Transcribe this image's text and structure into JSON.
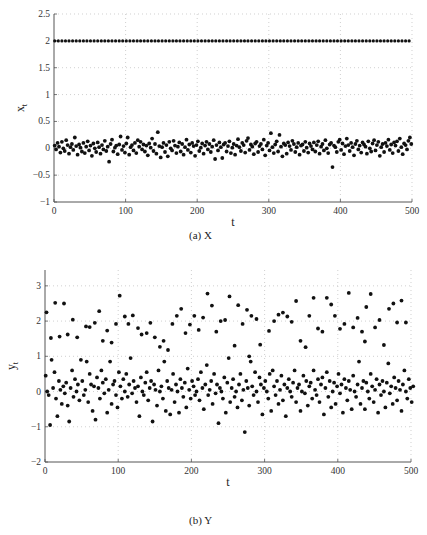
{
  "chart_data": [
    {
      "id": "X",
      "type": "scatter",
      "caption": "(a) X",
      "title": "",
      "xlabel": "t",
      "ylabel": "x",
      "ylabel_sub": "t",
      "xlim": [
        0,
        500
      ],
      "ylim": [
        -1,
        2.5
      ],
      "xticks": [
        0,
        100,
        200,
        300,
        400,
        500
      ],
      "yticks": [
        -1,
        -0.5,
        0,
        0.5,
        1,
        1.5,
        2,
        2.5
      ],
      "ytick_labels": [
        "−1",
        "−0.5",
        "0",
        "0.5",
        "1",
        "1.5",
        "2",
        "2.5"
      ],
      "grid": true,
      "legend": null,
      "frame": {
        "left": 54,
        "right": 412,
        "top": 14,
        "bottom": 202
      },
      "series": [
        {
          "name": "constant",
          "note": "points at x_t = 2 for every t",
          "t_start": 1,
          "t_end": 500,
          "t_step": 5,
          "value": 2
        },
        {
          "name": "noise",
          "note": "noise around 0, t = 1,3,5,...,499",
          "t_start": 1,
          "t_step": 2,
          "values": [
            0.05,
            -0.02,
            0.1,
            0.03,
            -0.08,
            0.12,
            0.0,
            -0.05,
            0.15,
            0.06,
            -0.1,
            0.02,
            0.08,
            -0.03,
            0.2,
            0.04,
            -0.12,
            0.07,
            0.01,
            -0.06,
            0.1,
            -0.09,
            0.03,
            0.13,
            -0.04,
            0.05,
            -0.14,
            0.09,
            0.0,
            -0.07,
            0.11,
            0.02,
            -0.1,
            0.06,
            -0.02,
            0.14,
            -0.05,
            0.03,
            -0.25,
            0.08,
            0.16,
            -0.06,
            0.01,
            0.05,
            -0.11,
            0.07,
            0.22,
            -0.03,
            0.04,
            -0.08,
            0.09,
            0.2,
            -0.12,
            0.02,
            0.06,
            -0.04,
            0.1,
            -0.09,
            0.15,
            0.03,
            0.12,
            -0.02,
            0.07,
            -0.06,
            0.05,
            -0.13,
            0.09,
            0.01,
            0.18,
            -0.05,
            0.08,
            -0.1,
            0.3,
            0.04,
            -0.17,
            0.02,
            0.1,
            -0.07,
            0.06,
            -0.15,
            0.12,
            0.0,
            -0.04,
            0.14,
            0.05,
            -0.09,
            0.03,
            0.11,
            -0.06,
            0.08,
            -0.12,
            0.02,
            0.16,
            -0.03,
            0.07,
            -0.08,
            0.1,
            0.04,
            -0.14,
            0.06,
            0.13,
            -0.05,
            0.01,
            0.09,
            -0.1,
            0.05,
            0.12,
            -0.02,
            0.08,
            -0.07,
            0.03,
            0.15,
            -0.2,
            0.06,
            -0.04,
            0.11,
            0.02,
            -0.18,
            0.07,
            0.1,
            -0.06,
            0.04,
            0.13,
            -0.09,
            0.01,
            0.08,
            -0.12,
            0.05,
            0.17,
            0.02,
            -0.05,
            0.1,
            0.06,
            -0.08,
            0.14,
            0.19,
            -0.03,
            0.07,
            0.03,
            -0.11,
            0.09,
            0.12,
            -0.07,
            0.04,
            0.08,
            -0.02,
            0.16,
            -0.13,
            0.05,
            0.1,
            -0.04,
            0.28,
            0.02,
            -0.09,
            0.07,
            0.13,
            -0.06,
            0.25,
            0.03,
            -0.15,
            0.09,
            0.06,
            -0.1,
            0.11,
            0.04,
            -0.03,
            0.14,
            0.08,
            -0.07,
            0.02,
            0.1,
            -0.12,
            0.05,
            0.07,
            -0.05,
            0.12,
            0.01,
            -0.08,
            0.09,
            0.04,
            -0.02,
            0.11,
            -0.06,
            0.06,
            0.13,
            -0.1,
            0.03,
            0.08,
            -0.04,
            0.15,
            0.0,
            -0.09,
            0.07,
            0.1,
            -0.35,
            0.05,
            0.02,
            -0.07,
            0.12,
            0.16,
            -0.03,
            0.09,
            -0.11,
            0.04,
            0.18,
            0.06,
            -0.05,
            0.1,
            0.02,
            -0.13,
            0.08,
            0.14,
            -0.02,
            0.05,
            -0.08,
            0.11,
            0.07,
            0.03,
            -0.1,
            0.13,
            0.0,
            -0.06,
            0.09,
            0.15,
            -0.04,
            0.06,
            0.12,
            -0.14,
            0.02,
            0.08,
            -0.07,
            0.1,
            0.04,
            0.16,
            -0.03,
            0.07,
            -0.09,
            0.11,
            0.05,
            0.13,
            -0.05,
            0.18,
            0.02,
            -0.11,
            0.09,
            0.06,
            -0.02,
            0.14,
            0.2,
            0.08
          ]
        }
      ]
    },
    {
      "id": "Y",
      "type": "scatter",
      "caption": "(b) Y",
      "title": "",
      "xlabel": "t",
      "ylabel": "y",
      "ylabel_sub": "t",
      "xlim": [
        0,
        500
      ],
      "ylim": [
        -2,
        3.45
      ],
      "xticks": [
        0,
        100,
        200,
        300,
        400,
        500
      ],
      "yticks": [
        -2,
        -1,
        0,
        1,
        2,
        3
      ],
      "ytick_labels": [
        "−2",
        "−1",
        "0",
        "1",
        "2",
        "3"
      ],
      "grid": true,
      "legend": null,
      "frame": {
        "left": 45,
        "right": 411,
        "top": 270,
        "bottom": 462
      },
      "series": [
        {
          "name": "upper-mode",
          "note": "points clustered around y_t ≈ 2",
          "points": [
            [
              2,
              2.25
            ],
            [
              8,
              1.52
            ],
            [
              14,
              2.52
            ],
            [
              20,
              1.56
            ],
            [
              26,
              2.5
            ],
            [
              31,
              1.62
            ],
            [
              38,
              2.04
            ],
            [
              44,
              1.54
            ],
            [
              56,
              1.85
            ],
            [
              61,
              1.83
            ],
            [
              68,
              1.95
            ],
            [
              74,
              2.28
            ],
            [
              79,
              1.44
            ],
            [
              85,
              1.73
            ],
            [
              91,
              1.39
            ],
            [
              97,
              1.92
            ],
            [
              102,
              2.72
            ],
            [
              109,
              2.13
            ],
            [
              114,
              1.92
            ],
            [
              120,
              2.16
            ],
            [
              127,
              1.8
            ],
            [
              132,
              1.62
            ],
            [
              139,
              1.66
            ],
            [
              144,
              1.95
            ],
            [
              150,
              1.54
            ],
            [
              157,
              1.27
            ],
            [
              162,
              1.44
            ],
            [
              168,
              1.18
            ],
            [
              174,
              1.92
            ],
            [
              180,
              2.15
            ],
            [
              186,
              2.35
            ],
            [
              192,
              1.66
            ],
            [
              198,
              1.9
            ],
            [
              204,
              2.15
            ],
            [
              210,
              1.75
            ],
            [
              216,
              2.1
            ],
            [
              222,
              2.78
            ],
            [
              228,
              2.44
            ],
            [
              234,
              1.7
            ],
            [
              240,
              2.0
            ],
            [
              246,
              2.03
            ],
            [
              252,
              2.7
            ],
            [
              259,
              1.3
            ],
            [
              264,
              2.45
            ],
            [
              270,
              1.92
            ],
            [
              276,
              2.32
            ],
            [
              279,
              1.0
            ],
            [
              282,
              2.15
            ],
            [
              289,
              2.06
            ],
            [
              294,
              1.33
            ],
            [
              306,
              1.72
            ],
            [
              313,
              2.0
            ],
            [
              319,
              2.18
            ],
            [
              325,
              2.24
            ],
            [
              331,
              2.13
            ],
            [
              337,
              1.98
            ],
            [
              343,
              2.57
            ],
            [
              349,
              1.44
            ],
            [
              356,
              1.26
            ],
            [
              361,
              2.15
            ],
            [
              367,
              2.66
            ],
            [
              373,
              1.79
            ],
            [
              379,
              1.7
            ],
            [
              385,
              2.66
            ],
            [
              391,
              2.47
            ],
            [
              396,
              2.15
            ],
            [
              403,
              1.78
            ],
            [
              409,
              1.92
            ],
            [
              415,
              2.8
            ],
            [
              421,
              1.82
            ],
            [
              427,
              2.09
            ],
            [
              433,
              1.7
            ],
            [
              437,
              1.42
            ],
            [
              439,
              2.4
            ],
            [
              445,
              2.77
            ],
            [
              451,
              1.82
            ],
            [
              457,
              2.03
            ],
            [
              463,
              1.32
            ],
            [
              470,
              2.35
            ],
            [
              476,
              2.5
            ],
            [
              481,
              1.96
            ],
            [
              487,
              2.58
            ],
            [
              493,
              1.96
            ]
          ]
        },
        {
          "name": "lower-mode",
          "note": "points clustered around y_t ≈ 0, t = 1,3,5,...,499",
          "t_start": 1,
          "t_step": 2,
          "values": [
            0.45,
            0.0,
            -0.1,
            -0.95,
            0.9,
            0.1,
            0.55,
            -0.2,
            -0.7,
            0.3,
            0.05,
            -0.35,
            0.15,
            -0.05,
            0.25,
            -0.4,
            -0.85,
            0.1,
            0.6,
            -0.15,
            0.35,
            0.0,
            0.2,
            -0.25,
            0.9,
            0.3,
            -0.1,
            0.05,
            0.85,
            -0.3,
            0.5,
            0.2,
            -0.55,
            0.15,
            -0.8,
            0.4,
            0.1,
            -0.2,
            0.6,
            0.25,
            -0.05,
            0.35,
            -0.6,
            0.05,
            0.85,
            -0.35,
            0.2,
            0.3,
            -0.1,
            -0.45,
            0.55,
            0.15,
            -0.2,
            0.35,
            0.0,
            0.5,
            -0.15,
            0.2,
            0.95,
            -0.05,
            0.3,
            0.1,
            -0.3,
            0.15,
            -0.7,
            0.4,
            0.0,
            -0.1,
            0.25,
            0.55,
            -0.25,
            0.1,
            0.3,
            -0.85,
            0.2,
            0.05,
            -0.4,
            0.6,
            0.0,
            0.15,
            -0.2,
            0.85,
            -0.55,
            0.3,
            0.1,
            -0.65,
            0.05,
            0.5,
            -0.3,
            0.2,
            0.0,
            -0.6,
            0.35,
            0.1,
            -0.15,
            0.25,
            -0.45,
            0.65,
            0.05,
            -0.2,
            0.3,
            0.15,
            -0.1,
            0.0,
            0.35,
            -0.25,
            0.55,
            0.1,
            -0.5,
            0.2,
            0.75,
            -0.1,
            0.05,
            0.3,
            -0.35,
            0.5,
            -0.05,
            0.2,
            -0.9,
            0.1,
            0.0,
            -0.2,
            0.4,
            -0.6,
            0.25,
            0.95,
            -0.3,
            0.1,
            0.35,
            -0.15,
            0.0,
            -0.45,
            0.2,
            0.5,
            -0.25,
            0.05,
            -1.15,
            0.3,
            0.1,
            -0.4,
            0.85,
            0.15,
            -0.1,
            0.55,
            0.0,
            -0.3,
            0.4,
            0.2,
            -0.65,
            0.1,
            0.3,
            0.0,
            -0.2,
            0.5,
            -0.55,
            0.6,
            0.15,
            -0.1,
            0.3,
            -0.35,
            0.05,
            0.45,
            -0.25,
            0.2,
            -0.7,
            0.1,
            0.35,
            0.0,
            -0.15,
            0.25,
            0.6,
            -0.3,
            0.1,
            0.2,
            -0.55,
            0.0,
            0.45,
            -0.05,
            0.3,
            -0.4,
            0.15,
            0.25,
            -0.2,
            0.6,
            0.05,
            -0.1,
            0.35,
            -0.3,
            0.2,
            0.4,
            -0.65,
            0.1,
            0.55,
            -0.15,
            0.3,
            -0.45,
            0.0,
            0.25,
            -0.35,
            0.15,
            0.5,
            -0.05,
            0.2,
            -0.6,
            0.35,
            0.1,
            -0.25,
            0.3,
            0.05,
            -0.5,
            0.45,
            0.0,
            -0.15,
            0.2,
            0.85,
            -0.35,
            0.1,
            0.3,
            -0.5,
            0.25,
            0.0,
            -0.2,
            0.5,
            0.15,
            -0.3,
            0.05,
            0.35,
            -0.6,
            0.2,
            -0.1,
            0.3,
            0.0,
            -0.45,
            0.25,
            0.8,
            -0.05,
            0.15,
            -0.35,
            0.4,
            0.1,
            -0.25,
            0.3,
            0.05,
            -0.55,
            0.2,
            0.6,
            0.0,
            -0.2,
            0.35,
            0.1,
            -0.3,
            0.15
          ]
        }
      ]
    }
  ],
  "captions": {
    "a": "(a) X",
    "b": "(b) Y"
  },
  "axis_labels": {
    "x_top": "t",
    "x_bottom": "t"
  }
}
